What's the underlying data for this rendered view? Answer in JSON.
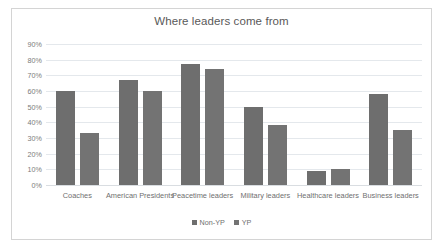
{
  "chart_data": {
    "type": "bar",
    "title": "Where leaders come from",
    "xlabel": "",
    "ylabel": "",
    "ylim": [
      0,
      90
    ],
    "ytick_step": 10,
    "ytick_labels": [
      "0%",
      "10%",
      "20%",
      "30%",
      "40%",
      "50%",
      "60%",
      "70%",
      "80%",
      "90%"
    ],
    "grid": true,
    "legend_position": "bottom",
    "categories": [
      "Coaches",
      "American Presidents",
      "Peacetime leaders",
      "Military leaders",
      "Healthcare leaders",
      "Business leaders"
    ],
    "series": [
      {
        "name": "Non-YP",
        "color": "#6e6e6e",
        "values": [
          60,
          67,
          77,
          50,
          9,
          58
        ]
      },
      {
        "name": "YP",
        "color": "#737373",
        "values": [
          33,
          60,
          74,
          38,
          10.5,
          35
        ]
      }
    ]
  },
  "legend": {
    "items": [
      {
        "label": "Non-YP"
      },
      {
        "label": "YP"
      }
    ]
  }
}
